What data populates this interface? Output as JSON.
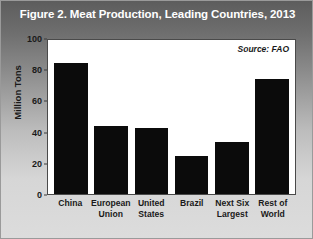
{
  "figure": {
    "title": "Figure 2. Meat Production, Leading Countries, 2013",
    "source_note": "Source: FAO"
  },
  "chart_data": {
    "type": "bar",
    "title": "Figure 2. Meat Production, Leading Countries, 2013",
    "xlabel": "",
    "ylabel": "Million Tons",
    "ylim": [
      0,
      100
    ],
    "yticks": [
      0,
      20,
      40,
      60,
      80,
      100
    ],
    "ytick_labels": [
      "0",
      "20",
      "40",
      "60",
      "80",
      "100"
    ],
    "grid": false,
    "legend": null,
    "annotations": [
      "Source: FAO"
    ],
    "bar_color": "#0b0b0b",
    "categories": [
      "China",
      "European Union",
      "United States",
      "Brazil",
      "Next Six Largest",
      "Rest of World"
    ],
    "category_lines": [
      [
        "China"
      ],
      [
        "European",
        "Union"
      ],
      [
        "United",
        "States"
      ],
      [
        "Brazil"
      ],
      [
        "Next Six",
        "Largest"
      ],
      [
        "Rest of",
        "World"
      ]
    ],
    "values": [
      85,
      44,
      43,
      25,
      34,
      75
    ]
  }
}
